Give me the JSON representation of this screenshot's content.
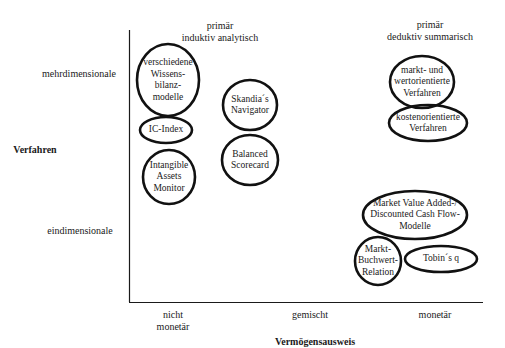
{
  "diagram": {
    "y_axis": {
      "title": "Verfahren",
      "top_label": "mehrdimensionale",
      "bottom_label": "eindimensionale"
    },
    "x_axis": {
      "title": "Vermögensausweis",
      "labels": [
        "nicht\nmonetär",
        "gemischt",
        "monetär"
      ]
    },
    "column_headers": [
      {
        "line1": "primär",
        "line2": "induktiv analytisch"
      },
      {
        "line1": "primär",
        "line2": "deduktiv summarisch"
      }
    ],
    "nodes": [
      {
        "id": "wissensbilanz",
        "text": "verschiedene\nWissens-\nbilanz-\nmodelle",
        "cx": 168,
        "cy": 80,
        "rx": 31,
        "ry": 36
      },
      {
        "id": "ic-index",
        "text": "IC-Index",
        "cx": 166,
        "cy": 130,
        "rx": 26,
        "ry": 13
      },
      {
        "id": "intangible-assets-monitor",
        "text": "Intangible\nAssets\nMonitor",
        "cx": 169,
        "cy": 177,
        "rx": 26,
        "ry": 27
      },
      {
        "id": "skandia-navigator",
        "text": "Skandia´s\nNavigator",
        "cx": 250,
        "cy": 105,
        "rx": 27,
        "ry": 25
      },
      {
        "id": "balanced-scorecard",
        "text": "Balanced\nScorecard",
        "cx": 250,
        "cy": 160,
        "rx": 28,
        "ry": 25
      },
      {
        "id": "markt-wertorientierte",
        "text": "markt- und\nwertorientierte\nVerfahren",
        "cx": 422,
        "cy": 82,
        "rx": 32,
        "ry": 26
      },
      {
        "id": "kostenorientierte",
        "text": "kostenorientierte\nVerfahren",
        "cx": 428,
        "cy": 123,
        "rx": 39,
        "ry": 18
      },
      {
        "id": "market-value-added",
        "text": "Market Value Added-/\nDiscounted Cash Flow-\nModelle",
        "cx": 415,
        "cy": 215,
        "rx": 52,
        "ry": 24
      },
      {
        "id": "markt-buchwert",
        "text": "Markt-\nBuchwert-\nRelation",
        "cx": 378,
        "cy": 261,
        "rx": 23,
        "ry": 24
      },
      {
        "id": "tobins-q",
        "text": "Tobin´s q",
        "cx": 441,
        "cy": 259,
        "rx": 36,
        "ry": 13
      }
    ]
  }
}
